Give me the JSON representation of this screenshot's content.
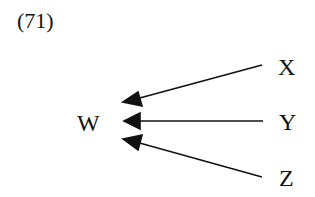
{
  "example_number": "(71)",
  "nodes": {
    "target": "W",
    "sources": [
      "X",
      "Y",
      "Z"
    ]
  },
  "edges": [
    {
      "from": "X",
      "to": "W"
    },
    {
      "from": "Y",
      "to": "W"
    },
    {
      "from": "Z",
      "to": "W"
    }
  ],
  "colors": {
    "ink": "#111111",
    "background": "#ffffff"
  }
}
